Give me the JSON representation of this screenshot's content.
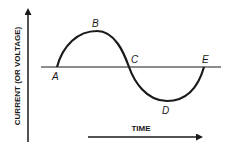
{
  "diagram": {
    "type": "sine-wave",
    "y_axis_label": "CURRENT (OR VOLTAGE)",
    "x_axis_label": "TIME",
    "points": [
      {
        "label": "A",
        "x": 57,
        "y": 67,
        "role": "start / zero crossing"
      },
      {
        "label": "B",
        "x": 97,
        "y": 31,
        "role": "positive peak"
      },
      {
        "label": "C",
        "x": 129,
        "y": 67,
        "role": "zero crossing"
      },
      {
        "label": "D",
        "x": 167,
        "y": 101,
        "role": "negative peak"
      },
      {
        "label": "E",
        "x": 204,
        "y": 67,
        "role": "end / zero crossing"
      }
    ],
    "colors": {
      "stroke": "#1a1a1a",
      "background": "#ffffff"
    }
  }
}
